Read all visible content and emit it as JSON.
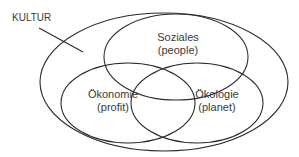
{
  "diagram": {
    "outer_label": "KULTUR",
    "circles": [
      {
        "title": "Soziales",
        "subtitle": "(people)"
      },
      {
        "title": "Ökonomie",
        "subtitle": "(profit)"
      },
      {
        "title": "Ökologie",
        "subtitle": "(planet)"
      }
    ],
    "stroke_color": "#2b2b2b",
    "background": "#ffffff"
  }
}
